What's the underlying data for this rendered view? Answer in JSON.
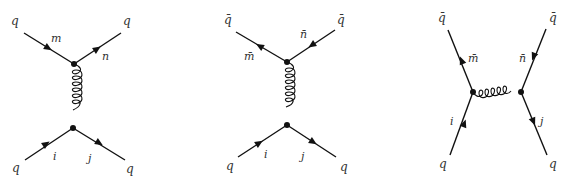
{
  "figure": {
    "diagrams": [
      {
        "id": "qq-t-channel",
        "particles": {
          "top_left": "q",
          "top_right": "q",
          "bottom_left": "q",
          "bottom_right": "q"
        },
        "color_indices": {
          "top_left": "m",
          "top_right": "n",
          "bottom_left": "i",
          "bottom_right": "j"
        },
        "propagator": "gluon",
        "orientation": "vertical"
      },
      {
        "id": "qqbar-t-channel",
        "particles": {
          "top_left": "q̄",
          "top_right": "q̄",
          "bottom_left": "q",
          "bottom_right": "q"
        },
        "color_indices": {
          "top_left": "m̄",
          "top_right": "n̄",
          "bottom_left": "i",
          "bottom_right": "j"
        },
        "propagator": "gluon",
        "orientation": "vertical"
      },
      {
        "id": "qqbar-s-channel",
        "particles": {
          "top_left": "q̄",
          "top_right": "q̄",
          "bottom_left": "q",
          "bottom_right": "q"
        },
        "color_indices": {
          "top_left": "m̄",
          "top_right": "n̄",
          "bottom_left": "i",
          "bottom_right": "j"
        },
        "propagator": "gluon",
        "orientation": "horizontal"
      }
    ]
  },
  "labels": {
    "d1": {
      "tl": "q",
      "tr": "q",
      "bl": "q",
      "br": "q",
      "m": "m",
      "n": "n",
      "i": "i",
      "j": "j"
    },
    "d2": {
      "tl": "q̄",
      "tr": "q̄",
      "bl": "q",
      "br": "q",
      "m": "m̄",
      "n": "n̄",
      "i": "i",
      "j": "j"
    },
    "d3": {
      "tl": "q̄",
      "tr": "q̄",
      "bl": "q",
      "br": "q",
      "m": "m̄",
      "n": "n̄",
      "i": "i",
      "j": "j"
    }
  }
}
